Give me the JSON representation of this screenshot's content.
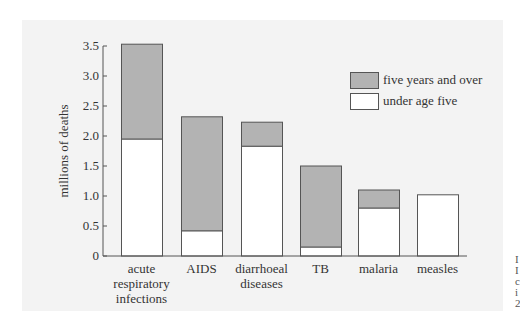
{
  "chart_data": {
    "type": "bar",
    "stacked": true,
    "title": "",
    "xlabel": "",
    "ylabel": "millions of deaths",
    "ylim": [
      0,
      3.5
    ],
    "yticks": [
      "0",
      "0.5",
      "1.0",
      "1.5",
      "2.0",
      "2.5",
      "3.0",
      "3.5"
    ],
    "grid": false,
    "legend_position": "upper right",
    "categories": [
      [
        "acute",
        "respiratory",
        "infections"
      ],
      [
        "AIDS"
      ],
      [
        "diarrhoeal",
        "diseases"
      ],
      [
        "TB"
      ],
      [
        "malaria"
      ],
      [
        "measles"
      ]
    ],
    "series": [
      {
        "name": "under age five",
        "color": "#ffffff",
        "values": [
          1.95,
          0.42,
          1.83,
          0.15,
          0.8,
          1.02
        ]
      },
      {
        "name": "five years and over",
        "color": "#b3b3b3",
        "values": [
          1.58,
          1.9,
          0.4,
          1.35,
          0.3,
          0.0
        ]
      }
    ],
    "totals": [
      3.53,
      2.32,
      2.23,
      1.5,
      1.1,
      1.02
    ]
  },
  "legend": {
    "items": [
      {
        "label": "five years and over",
        "color": "#b3b3b3"
      },
      {
        "label": "under age five",
        "color": "#ffffff"
      }
    ]
  },
  "edge_text": [
    "I",
    "I",
    "c",
    "i",
    "2"
  ]
}
